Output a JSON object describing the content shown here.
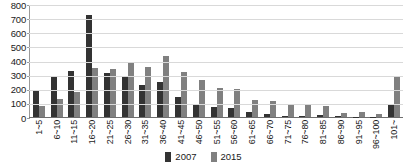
{
  "chart_data": {
    "type": "bar",
    "title": "",
    "subtitle": "",
    "xlabel": "",
    "ylabel": "",
    "ylim": [
      0,
      800
    ],
    "yticks": [
      0,
      100,
      200,
      300,
      400,
      500,
      600,
      700,
      800
    ],
    "ytick_labels": [
      "0",
      "100",
      "200",
      "300",
      "400",
      "500",
      "600",
      "700",
      "800"
    ],
    "grid": true,
    "legend_position": "bottom-center",
    "categories": [
      "1~5",
      "6~10",
      "11~15",
      "16~20",
      "21~25",
      "26~30",
      "31~35",
      "36~40",
      "41~45",
      "46~50",
      "51~55",
      "56~60",
      "61~65",
      "66~70",
      "71~75",
      "76~80",
      "81~85",
      "86~90",
      "91~95",
      "96~100",
      "101~"
    ],
    "series": [
      {
        "name": "2007",
        "color": "#333333",
        "values": [
          190,
          280,
          325,
          720,
          310,
          280,
          225,
          245,
          140,
          88,
          68,
          65,
          35,
          18,
          8,
          10,
          12,
          5,
          3,
          3,
          85
        ]
      },
      {
        "name": "2015",
        "color": "#808080",
        "values": [
          80,
          130,
          175,
          348,
          340,
          390,
          352,
          430,
          318,
          260,
          208,
          197,
          120,
          113,
          92,
          82,
          75,
          25,
          38,
          22,
          290
        ]
      }
    ]
  },
  "legend": {
    "items": [
      {
        "label": "2007",
        "color": "#333333"
      },
      {
        "label": "2015",
        "color": "#808080"
      }
    ]
  }
}
